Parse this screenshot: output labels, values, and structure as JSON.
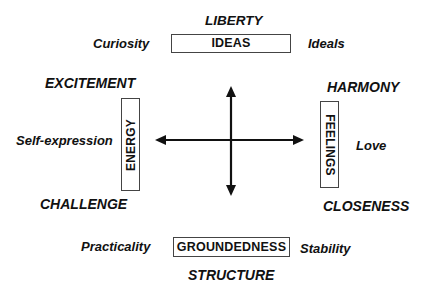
{
  "diagram": {
    "type": "four-axis concept diagram",
    "center": {
      "horizontal_arrow": "bidirectional",
      "vertical_arrow": "bidirectional"
    },
    "top": {
      "box_label": "IDEAS",
      "heading": "LIBERTY",
      "left_label": "Curiosity",
      "right_label": "Ideals"
    },
    "left": {
      "box_label": "ENERGY",
      "heading_top": "EXCITEMENT",
      "side_label": "Self-expression",
      "heading_bottom": "CHALLENGE"
    },
    "right": {
      "box_label": "FEELINGS",
      "heading_top": "HARMONY",
      "side_label": "Love",
      "heading_bottom": "CLOSENESS"
    },
    "bottom": {
      "box_label": "GROUNDEDNESS",
      "heading": "STRUCTURE",
      "left_label": "Practicality",
      "right_label": "Stability"
    },
    "colors": {
      "text": "#111111",
      "box_border": "#444444",
      "arrow": "#111111",
      "background": "#ffffff"
    }
  }
}
